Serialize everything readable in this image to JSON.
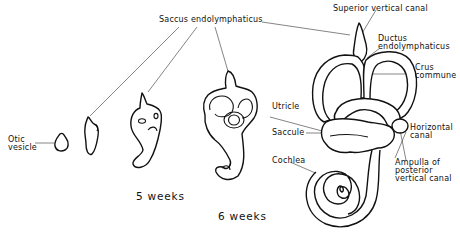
{
  "figure": {
    "stages": [
      {
        "id": "otic-vesicle",
        "label": "Otic vesicle"
      },
      {
        "id": "stage-2"
      },
      {
        "id": "stage-3"
      },
      {
        "id": "stage-4"
      },
      {
        "id": "stage-5"
      }
    ],
    "time_labels": {
      "five_weeks": "5 weeks",
      "six_weeks": "6 weeks"
    },
    "labels": {
      "otic_vesicle_line1": "Otic",
      "otic_vesicle_line2": "vesicle",
      "saccus_endolymphaticus": "Saccus endolymphaticus",
      "superior_vertical_canal": "Superior vertical canal",
      "ductus_line1": "Ductus",
      "ductus_line2": "endolymphaticus",
      "crus_line1": "Crus",
      "crus_line2": "commune",
      "utricle": "Utricle",
      "saccule": "Saccule",
      "horizontal_line1": "Horizontal",
      "horizontal_line2": "canal",
      "cochlea": "Cochlea",
      "ampulla_line1": "Ampulla of",
      "ampulla_line2": "posterior",
      "ampulla_line3": "vertical canal"
    }
  }
}
